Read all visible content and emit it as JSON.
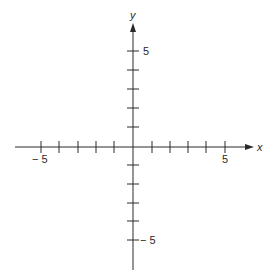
{
  "diagram": {
    "type": "cartesian-coordinate-plane",
    "caption_partial": "",
    "colors": {
      "axis": "#2a2a2a",
      "background": "#ffffff",
      "label": "#2a2a2a"
    },
    "x_axis": {
      "name": "x",
      "range": [
        -5,
        5
      ],
      "tick_step": 1,
      "labeled_ticks": [
        {
          "value": -5,
          "label": "− 5"
        },
        {
          "value": 5,
          "label": "5"
        }
      ],
      "arrow": "positive-end"
    },
    "y_axis": {
      "name": "y",
      "range": [
        -5,
        5
      ],
      "tick_step": 1,
      "labeled_ticks": [
        {
          "value": 5,
          "label": "5"
        },
        {
          "value": -5,
          "label": "− 5"
        }
      ],
      "arrow": "positive-end"
    }
  }
}
